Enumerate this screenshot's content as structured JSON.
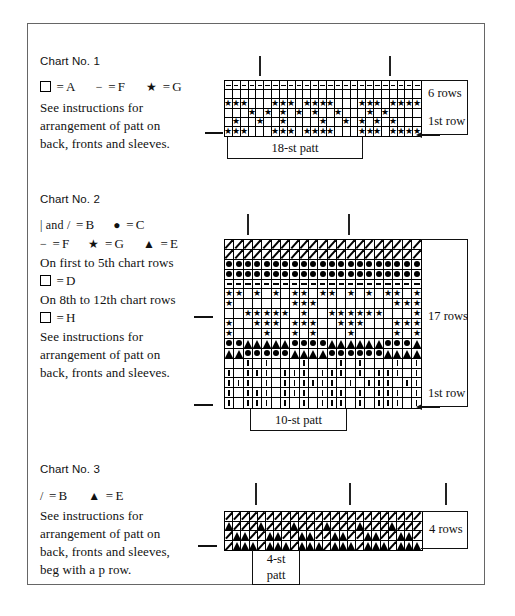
{
  "page": {
    "background": "#ffffff",
    "border_color": "#666666"
  },
  "charts": [
    {
      "id": "chart-1",
      "title": "Chart No. 1",
      "legend": [
        {
          "symbol": "square",
          "symbol_text": "❑",
          "equals": "=",
          "value": "A"
        },
        {
          "symbol": "dash",
          "symbol_text": "−",
          "equals": "=",
          "value": "F"
        },
        {
          "symbol": "star",
          "symbol_text": "★",
          "equals": "=",
          "value": "G"
        }
      ],
      "notes": [
        "See instructions for",
        "arrangement of patt on",
        "back, fronts and sleeves."
      ],
      "rows_label": "6 rows",
      "first_row_label": "1st row",
      "patt_label": "18-st patt",
      "grid": {
        "columns": 25,
        "rows": 6,
        "cell_symbols": [
          [
            "-",
            "-",
            "-",
            "-",
            "-",
            "-",
            "-",
            "-",
            "-",
            "-",
            "-",
            "-",
            "-",
            "-",
            "-",
            "-",
            "-",
            "-",
            "-",
            "-",
            "-",
            "-",
            "-",
            "-",
            "-"
          ],
          [
            "",
            "",
            "",
            "",
            "",
            "",
            "",
            "",
            "",
            "",
            "",
            "",
            "",
            "",
            "",
            "",
            "",
            "",
            "",
            "",
            "",
            "",
            "",
            "",
            ""
          ],
          [
            "*",
            "*",
            "*",
            "",
            "",
            "",
            "*",
            "*",
            "*",
            "",
            "*",
            "*",
            "*",
            "*",
            "",
            "",
            "",
            "*",
            "*",
            "*",
            "",
            "*",
            "*",
            "*",
            "*"
          ],
          [
            "",
            "",
            "",
            "*",
            "",
            "*",
            "",
            "*",
            "",
            "*",
            "",
            "*",
            "",
            "",
            "*",
            "",
            "",
            "",
            "*",
            "",
            "*",
            "",
            "",
            "",
            ""
          ],
          [
            "",
            "*",
            "",
            "",
            "*",
            "",
            "",
            "*",
            "",
            "",
            "",
            "",
            "*",
            "",
            "",
            "*",
            "",
            "*",
            "",
            "*",
            "",
            "*",
            "",
            "",
            ""
          ],
          [
            "*",
            "*",
            "*",
            "",
            "",
            "",
            "*",
            "*",
            "*",
            "",
            "*",
            "*",
            "*",
            "*",
            "",
            "",
            "",
            "*",
            "*",
            "*",
            "",
            "*",
            "*",
            "*",
            "*"
          ]
        ]
      }
    },
    {
      "id": "chart-2",
      "title": "Chart No. 2",
      "legend": [
        {
          "symbol": "bar-slash",
          "symbol_text": "| and /",
          "equals": "=",
          "value": "B"
        },
        {
          "symbol": "dot",
          "symbol_text": "●",
          "equals": "=",
          "value": "C"
        },
        {
          "symbol": "dash",
          "symbol_text": "−",
          "equals": "=",
          "value": "F"
        },
        {
          "symbol": "star",
          "symbol_text": "★",
          "equals": "=",
          "value": "G"
        },
        {
          "symbol": "triangle",
          "symbol_text": "▲",
          "equals": "=",
          "value": "E"
        }
      ],
      "conditions": [
        {
          "text": "On first to 5th chart rows",
          "symbol": "square",
          "symbol_text": "❑",
          "equals": "=",
          "value": "D"
        },
        {
          "text": "On 8th to 12th chart rows",
          "symbol": "square",
          "symbol_text": "❑",
          "equals": "=",
          "value": "H"
        }
      ],
      "notes": [
        "See instructions for",
        "arrangement of patt on",
        "back, fronts and sleeves."
      ],
      "rows_label": "17 rows",
      "first_row_label": "1st row",
      "patt_label": "10-st patt",
      "grid": {
        "columns": 21,
        "rows": 17,
        "cell_symbols": [
          [
            "/",
            "/",
            "/",
            "/",
            "/",
            "/",
            "/",
            "/",
            "/",
            "/",
            "/",
            "/",
            "/",
            "/",
            "/",
            "/",
            "/",
            "/",
            "/",
            "/",
            "/"
          ],
          [
            "/",
            "/",
            "/",
            "/",
            "/",
            "/",
            "/",
            "/",
            "/",
            "/",
            "/",
            "/",
            "/",
            "/",
            "/",
            "/",
            "/",
            "/",
            "/",
            "/",
            "/"
          ],
          [
            "o",
            "o",
            "o",
            "o",
            "o",
            "o",
            "o",
            "o",
            "o",
            "o",
            "o",
            "o",
            "o",
            "o",
            "o",
            "o",
            "o",
            "o",
            "o",
            "o",
            "o"
          ],
          [
            "o",
            "o",
            "o",
            "o",
            "o",
            "o",
            "o",
            "o",
            "o",
            "o",
            "o",
            "o",
            "o",
            "o",
            "o",
            "o",
            "o",
            "o",
            "o",
            "o",
            "o"
          ],
          [
            "-",
            "-",
            "-",
            "-",
            "-",
            "-",
            "-",
            "-",
            "-",
            "-",
            "-",
            "-",
            "-",
            "-",
            "-",
            "-",
            "-",
            "-",
            "-",
            "-",
            "-"
          ],
          [
            "*",
            "*",
            "",
            "*",
            "",
            "*",
            "",
            "*",
            "*",
            "",
            "*",
            "*",
            "",
            "*",
            "",
            "*",
            "",
            "*",
            "*",
            "",
            "*"
          ],
          [
            "*",
            "",
            "",
            "",
            "",
            "",
            "",
            "*",
            "*",
            "*",
            "",
            "",
            "",
            "",
            "",
            "",
            "",
            "",
            "*",
            "*",
            "*"
          ],
          [
            "",
            "",
            "*",
            "*",
            "*",
            "*",
            "*",
            "",
            "*",
            "",
            "",
            "*",
            "*",
            "*",
            "*",
            "*",
            "*",
            "",
            "",
            "",
            "*"
          ],
          [
            "*",
            "",
            "",
            "*",
            "*",
            "*",
            "",
            "*",
            "*",
            "*",
            "",
            "",
            "*",
            "*",
            "*",
            "",
            "",
            "",
            "*",
            "*",
            "*"
          ],
          [
            "*",
            "",
            "",
            "",
            "*",
            "",
            "",
            "*",
            "",
            "*",
            "",
            "",
            "",
            "*",
            "",
            "",
            "",
            "",
            "*",
            "",
            "*"
          ],
          [
            "o",
            "o",
            "^",
            "^",
            "^",
            "^",
            "^",
            "o",
            "o",
            "o",
            "o",
            "^",
            "^",
            "^",
            "^",
            "^",
            "^",
            "o",
            "o",
            "o",
            "^"
          ],
          [
            "^",
            "^",
            "o",
            "o",
            "o",
            "o",
            "o",
            "^",
            "^",
            "^",
            "^",
            "o",
            "o",
            "o",
            "o",
            "o",
            "o",
            "^",
            "^",
            "^",
            "^"
          ],
          [
            "",
            "",
            "|",
            "",
            "|",
            "",
            "",
            "",
            "|",
            "",
            "",
            "",
            "|",
            "",
            "|",
            "",
            "",
            "",
            "|",
            "",
            "|"
          ],
          [
            "|",
            "",
            "|",
            "|",
            "|",
            "",
            "|",
            "|",
            "|",
            "",
            "|",
            "|",
            "|",
            "",
            "|",
            "",
            "|",
            "|",
            "|",
            "",
            "|"
          ],
          [
            "|",
            "|",
            "|",
            "",
            "|",
            "",
            "|",
            "|",
            "|",
            "|",
            "|",
            "|",
            "",
            "|",
            "",
            "|",
            "|",
            "|",
            "",
            "|",
            "|"
          ],
          [
            "|",
            "",
            "|",
            "|",
            "|",
            "",
            "|",
            "|",
            "|",
            "",
            "|",
            "|",
            "|",
            "",
            "|",
            "",
            "|",
            "|",
            "|",
            "",
            "|"
          ],
          [
            "|",
            "",
            "|",
            "|",
            "|",
            "",
            "|",
            "",
            "|",
            "",
            "|",
            "|",
            "|",
            "",
            "|",
            "",
            "|",
            "|",
            "|",
            "",
            "|"
          ]
        ]
      }
    },
    {
      "id": "chart-3",
      "title": "Chart No. 3",
      "legend": [
        {
          "symbol": "slash",
          "symbol_text": "/",
          "equals": "=",
          "value": "B"
        },
        {
          "symbol": "triangle",
          "symbol_text": "▲",
          "equals": "=",
          "value": "E"
        }
      ],
      "notes": [
        "See instructions for",
        "arrangement of patt on",
        "back, fronts and sleeves,",
        "beg with a p row."
      ],
      "rows_label": "4 rows",
      "patt_label_line1": "4-st",
      "patt_label_line2": "patt",
      "grid": {
        "columns": 24,
        "rows": 4,
        "cell_symbols": [
          [
            "/",
            "/",
            "/",
            "/",
            "/",
            "/",
            "/",
            "/",
            "/",
            "/",
            "/",
            "/",
            "/",
            "/",
            "/",
            "/",
            "/",
            "/",
            "/",
            "/",
            "/",
            "/",
            "/",
            "/"
          ],
          [
            "^",
            "/",
            "/",
            "/",
            "^",
            "/",
            "/",
            "/",
            "^",
            "/",
            "/",
            "/",
            "^",
            "/",
            "/",
            "/",
            "^",
            "/",
            "/",
            "/",
            "^",
            "/",
            "/",
            "/"
          ],
          [
            "/",
            "^",
            "^",
            "/",
            "/",
            "^",
            "^",
            "/",
            "/",
            "^",
            "^",
            "/",
            "/",
            "^",
            "^",
            "/",
            "/",
            "^",
            "^",
            "/",
            "/",
            "^",
            "^",
            "/"
          ],
          [
            "/",
            "^",
            "^",
            "^",
            "/",
            "^",
            "^",
            "^",
            "/",
            "^",
            "^",
            "^",
            "/",
            "^",
            "^",
            "^",
            "/",
            "^",
            "^",
            "^",
            "/",
            "^",
            "^",
            "^"
          ]
        ]
      }
    }
  ]
}
